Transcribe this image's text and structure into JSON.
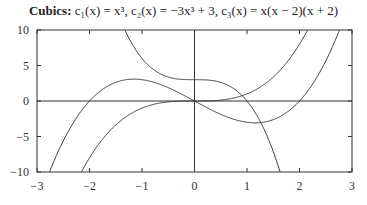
{
  "chart_data": {
    "type": "line",
    "title_parts": {
      "bold": "Cubics:",
      "rest": "c₁(x) = x³, c₂(x) = −3x³ + 3, c₃(x) = x(x − 2)(x + 2)"
    },
    "xlabel": "",
    "ylabel": "",
    "xlim": [
      -3,
      3
    ],
    "ylim": [
      -10,
      10
    ],
    "xticks": [
      -3,
      -2,
      -1,
      0,
      1,
      2,
      3
    ],
    "xtick_labels": [
      "−3",
      "−2",
      "−1",
      "0",
      "1",
      "2",
      "3"
    ],
    "yticks": [
      -10,
      -5,
      0,
      5,
      10
    ],
    "ytick_labels": [
      "−10",
      "−5",
      "0",
      "5",
      "10"
    ],
    "grid": false,
    "axes_lines": {
      "x0": true,
      "y0": true
    },
    "series": [
      {
        "name": "c1(x) = x^3",
        "expr": "x^3",
        "color": "#333333"
      },
      {
        "name": "c2(x) = -3x^3 + 3",
        "expr": "-3x^3+3",
        "color": "#333333"
      },
      {
        "name": "c3(x) = x(x-2)(x+2)",
        "expr": "x(x-2)(x+2)",
        "color": "#333333"
      }
    ]
  }
}
